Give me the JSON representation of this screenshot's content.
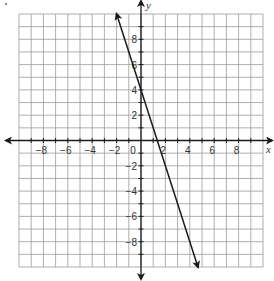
{
  "chart_data": {
    "type": "line",
    "title": "",
    "xlabel": "x",
    "ylabel": "y",
    "xlim": [
      -10,
      10
    ],
    "ylim": [
      -10,
      10
    ],
    "grid": true,
    "x_ticks": [
      -8,
      -6,
      -4,
      -2,
      0,
      2,
      4,
      6,
      8
    ],
    "y_ticks": [
      -8,
      -6,
      -4,
      -2,
      2,
      4,
      6,
      8
    ],
    "x_tick_labels": [
      "−8",
      "−6",
      "−4",
      "−2",
      "0",
      "2",
      "4",
      "6",
      "8"
    ],
    "y_tick_labels": [
      "−8",
      "−6",
      "−4",
      "−2",
      "2",
      "4",
      "6",
      "8"
    ],
    "series": [
      {
        "name": "line",
        "equation": "y = -3x + 4",
        "slope": -3,
        "y_intercept": 4,
        "x": [
          -2,
          0,
          1.333,
          4.667
        ],
        "y": [
          10,
          4,
          0,
          -10
        ],
        "arrows_both_ends": true,
        "color": "#1a1a1a"
      }
    ]
  },
  "labels": {
    "x_axis": "x",
    "y_axis": "y",
    "origin": "0"
  },
  "colors": {
    "grid": "#9a9a9a",
    "axis": "#1a1a1a",
    "line": "#1a1a1a"
  }
}
